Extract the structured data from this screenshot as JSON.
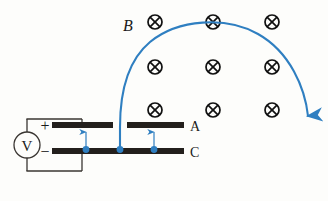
{
  "figure": {
    "background_color": "#fdfdfb",
    "width": 328,
    "height": 201
  },
  "colors": {
    "trajectory": "#2f7fc1",
    "trajectory_dark": "#2f7fc1",
    "plate": "#231f1c",
    "wire": "#3a3632",
    "field_marker": "#111111",
    "text": "#1a1a1a",
    "field_dot": "#2f7fc1"
  },
  "labels": {
    "magnetic_field": "B",
    "plate_top": "A",
    "plate_bottom": "C",
    "voltmeter": "V",
    "terminal_positive": "+",
    "terminal_negative": "−"
  },
  "magnetic_field": {
    "symbol": "cross-in-circle",
    "direction": "into-page",
    "count": 9,
    "radius": 7,
    "markers": [
      {
        "x": 155,
        "y": 22
      },
      {
        "x": 213,
        "y": 22
      },
      {
        "x": 272,
        "y": 22
      },
      {
        "x": 155,
        "y": 67
      },
      {
        "x": 213,
        "y": 67
      },
      {
        "x": 272,
        "y": 67
      },
      {
        "x": 155,
        "y": 110
      },
      {
        "x": 213,
        "y": 110
      },
      {
        "x": 272,
        "y": 110
      }
    ]
  },
  "capacitor": {
    "plate_top": {
      "y": 125,
      "segments": [
        {
          "x1": 52,
          "x2": 113
        },
        {
          "x1": 127,
          "x2": 184
        }
      ],
      "gap": {
        "x1": 113,
        "x2": 127
      },
      "thickness": 6
    },
    "plate_bottom": {
      "y": 151,
      "x1": 52,
      "x2": 184,
      "thickness": 6
    }
  },
  "circuit": {
    "voltmeter": {
      "cx": 27,
      "cy": 145,
      "r": 13
    },
    "wires": [
      {
        "x1": 27,
        "y1": 119,
        "x2": 27,
        "y2": 132,
        "name": "wire-voltmeter-top"
      },
      {
        "x1": 27,
        "y1": 158,
        "x2": 27,
        "y2": 171,
        "name": "wire-voltmeter-bottom"
      },
      {
        "x1": 27,
        "y1": 119,
        "x2": 82,
        "y2": 119,
        "name": "wire-top-horizontal"
      },
      {
        "x1": 27,
        "y1": 171,
        "x2": 82,
        "y2": 171,
        "name": "wire-bottom-horizontal"
      },
      {
        "x1": 82,
        "y1": 119,
        "x2": 82,
        "y2": 125,
        "name": "wire-lead-to-plate-a"
      },
      {
        "x1": 82,
        "y1": 151,
        "x2": 82,
        "y2": 171,
        "name": "wire-lead-to-plate-c"
      }
    ],
    "terminal_positive_pos": {
      "x": 45,
      "y": 125
    },
    "terminal_negative_pos": {
      "x": 45,
      "y": 151
    }
  },
  "field_indicators": {
    "description": "electric-field-arrows-between-plates",
    "dots": [
      {
        "x": 86,
        "y": 150,
        "r": 3.4
      },
      {
        "x": 120,
        "y": 150,
        "r": 3.4
      },
      {
        "x": 154,
        "y": 150,
        "r": 3.4
      }
    ],
    "arrows": [
      {
        "x": 86,
        "y_from": 147,
        "y_to": 131
      },
      {
        "x": 154,
        "y_from": 147,
        "y_to": 131
      }
    ]
  },
  "trajectory": {
    "description": "blue-curved-path-of-charged-particle",
    "stroke_width": 2.1,
    "path": "M 120 150 L 120 127 C 120 95 126 62 150 42 C 178 19 226 16 258 34 C 290 52 305 88 309 118",
    "arrow_tip": {
      "x": 310,
      "y": 130
    },
    "arrow_angle_deg": 100
  },
  "text_positions": {
    "magnetic_field_label": {
      "x": 128,
      "y": 30,
      "size": 15
    },
    "plate_top_label": {
      "x": 190,
      "y": 131,
      "size": 14
    },
    "plate_bottom_label": {
      "x": 190,
      "y": 157,
      "size": 14
    },
    "voltmeter_label": {
      "x": 27,
      "y": 150,
      "size": 15
    },
    "terminal_positive": {
      "x": 45,
      "y": 130,
      "size": 15
    },
    "terminal_negative": {
      "x": 45,
      "y": 156,
      "size": 15
    }
  }
}
